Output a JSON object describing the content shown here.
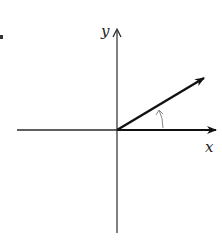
{
  "diagram": {
    "type": "coordinate-axes-with-vector",
    "axes": {
      "x_label": "x",
      "y_label": "y"
    },
    "vector": {
      "description": "vector from origin at angle above positive x-axis"
    },
    "angle_arc": {
      "description": "small arc with arrowhead indicating angle between x-axis and vector"
    },
    "colors": {
      "axis": "#2a2a2a",
      "vector": "#111111",
      "arc": "#888888",
      "background": "#ffffff"
    }
  }
}
